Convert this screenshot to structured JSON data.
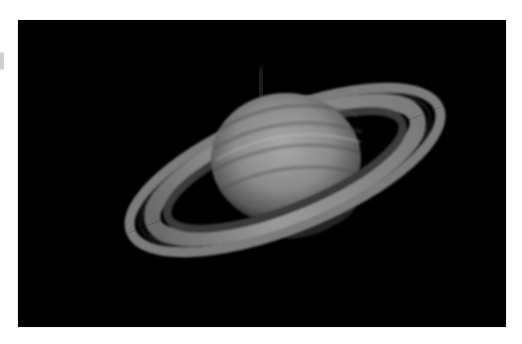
{
  "image": {
    "subject": "Saturn",
    "description": "Grayscale telescope photograph of Saturn with tilted ring system on black background",
    "background_color": "#000000",
    "page_background": "#ffffff"
  }
}
